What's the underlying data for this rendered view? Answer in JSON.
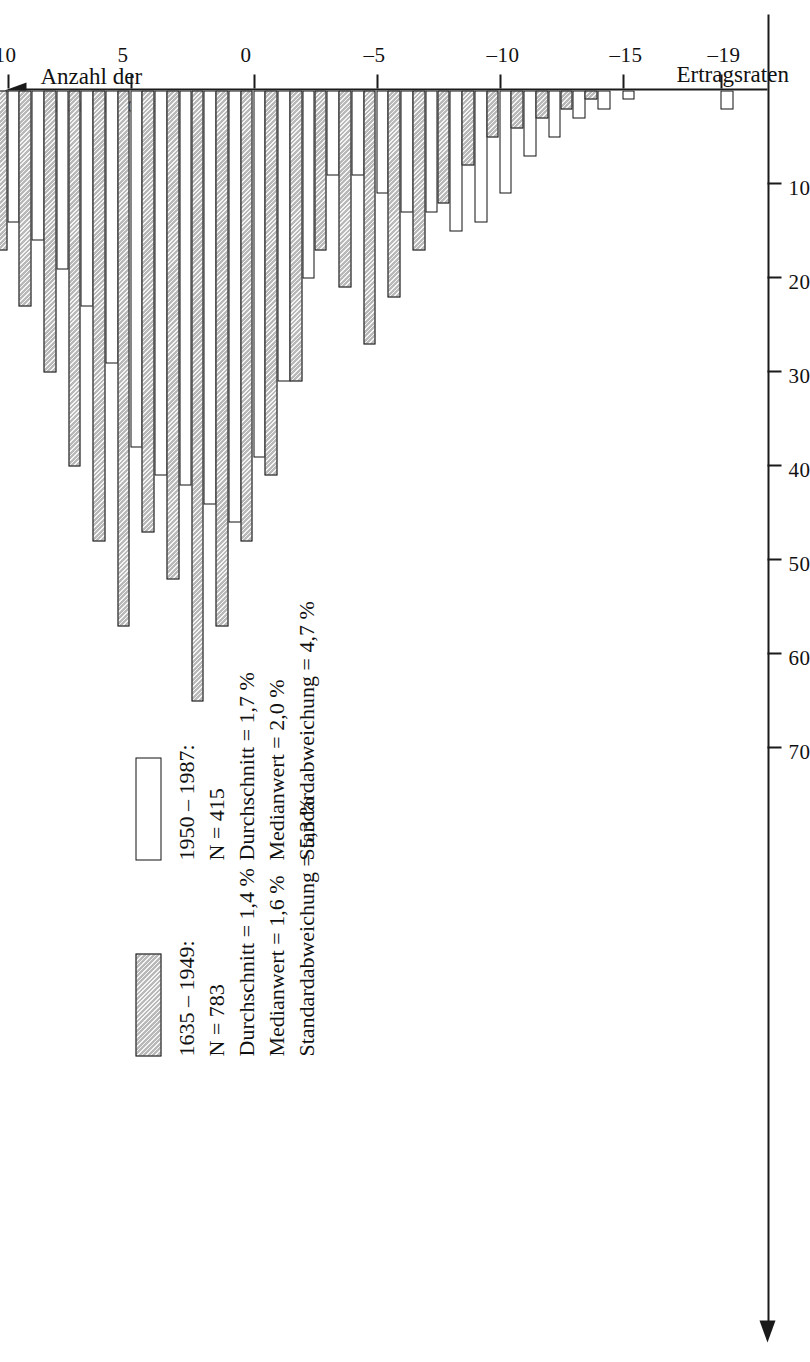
{
  "chart_data": {
    "type": "bar",
    "orientation": "horizontal-rotated",
    "title": "",
    "xlabel": "Ertragsraten",
    "ylabel": "Anzahl der Transaktionen",
    "ylabel_line1": "Anzahl der",
    "ylabel_line2": "Transaktionen",
    "grid": false,
    "value_axis": {
      "ticks": [
        10,
        20,
        30,
        40,
        50,
        60,
        70
      ],
      "tick_labels": [
        "10",
        "20",
        "30",
        "40",
        "50",
        "60",
        "70"
      ],
      "range": [
        0,
        75
      ]
    },
    "category_axis": {
      "ticks": [
        -19,
        -15,
        -10,
        -5,
        0,
        5,
        10,
        15,
        20,
        26
      ],
      "tick_labels": [
        "–19",
        "–15",
        "–10",
        "–5",
        "0",
        "5",
        "10",
        "15",
        "20",
        "26"
      ],
      "range": [
        -20,
        28
      ]
    },
    "categories": [
      -19,
      -18,
      -17,
      -16,
      -15,
      -14,
      -13,
      -12,
      -11,
      -10,
      -9,
      -8,
      -7,
      -6,
      -5,
      -4,
      -3,
      -2,
      -1,
      0,
      1,
      2,
      3,
      4,
      5,
      6,
      7,
      8,
      9,
      10,
      11,
      12,
      13,
      14,
      15,
      16,
      17,
      18,
      19,
      20,
      21,
      22,
      23,
      24,
      25,
      26
    ],
    "series": [
      {
        "name": "1635 – 1949",
        "key": "old",
        "fill": "hatched-gray",
        "color": "#b9b9b9",
        "values": [
          0,
          0,
          0,
          0,
          0,
          1,
          2,
          3,
          4,
          5,
          8,
          12,
          17,
          22,
          27,
          21,
          17,
          31,
          41,
          48,
          57,
          65,
          52,
          47,
          57,
          48,
          40,
          30,
          23,
          17,
          10,
          7,
          5,
          8,
          6,
          4,
          2,
          3,
          1,
          5,
          1,
          0,
          1,
          0,
          0,
          2
        ]
      },
      {
        "name": "1950 – 1987",
        "key": "new",
        "fill": "white",
        "color": "#ffffff",
        "values": [
          2,
          0,
          0,
          0,
          1,
          2,
          3,
          5,
          7,
          11,
          14,
          15,
          13,
          13,
          11,
          9,
          9,
          20,
          31,
          39,
          46,
          44,
          42,
          41,
          38,
          29,
          23,
          19,
          16,
          14,
          9,
          7,
          5,
          5,
          3,
          2,
          1,
          1,
          0,
          1,
          0,
          0,
          0,
          0,
          0,
          0
        ]
      }
    ]
  },
  "legend": {
    "entries": [
      {
        "swatch": "hatched-gray-swatch",
        "title": "1635 – 1949:",
        "lines": [
          "N = 783",
          "Durchschnitt = 1,4 %",
          "Medianwert = 1,6 %",
          "Standardabweichung = 5,3 %"
        ]
      },
      {
        "swatch": "white-swatch",
        "title": "1950 – 1987:",
        "lines": [
          "N = 415",
          "Durchschnitt = 1,7 %",
          "Medianwert = 2,0 %",
          "Standardabweichung = 4,7 %"
        ]
      }
    ]
  }
}
